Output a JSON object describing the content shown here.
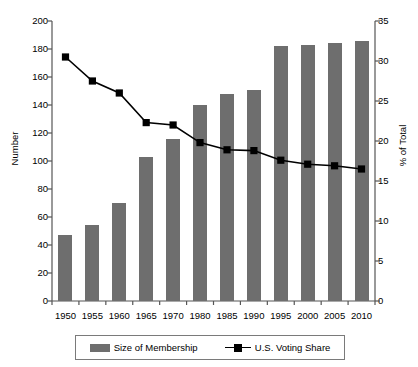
{
  "chart_data": {
    "type": "bar",
    "title": "",
    "subtitle": "",
    "categories": [
      "1950",
      "1955",
      "1960",
      "1965",
      "1970",
      "1980",
      "1985",
      "1990",
      "1995",
      "2000",
      "2005",
      "2010"
    ],
    "xlabel": "",
    "grid": false,
    "legend_position": "bottom",
    "series": [
      {
        "name": "Size of Membership",
        "type": "bar",
        "axis": "left",
        "color": "#6e6e6e",
        "values": [
          47,
          54,
          70,
          103,
          116,
          140,
          148,
          151,
          182,
          183,
          184,
          186
        ]
      },
      {
        "name": "U.S. Voting Share",
        "type": "line",
        "axis": "right",
        "color": "#000000",
        "marker": "square",
        "values": [
          30.5,
          27.5,
          26.0,
          22.3,
          22.0,
          19.8,
          18.9,
          18.8,
          17.6,
          17.1,
          16.9,
          16.5
        ]
      }
    ],
    "axes": {
      "left": {
        "label": "Number",
        "min": 0,
        "max": 200,
        "step": 20,
        "ticks": [
          "0",
          "20",
          "40",
          "60",
          "80",
          "100",
          "120",
          "140",
          "160",
          "180",
          "200"
        ]
      },
      "right": {
        "label": "% of Total",
        "min": 0,
        "max": 35,
        "step": 5,
        "ticks": [
          "0",
          "5",
          "10",
          "15",
          "20",
          "25",
          "30",
          "35"
        ]
      }
    }
  },
  "legend": {
    "items": [
      {
        "label": "Size of Membership",
        "marker": "bar-swatch"
      },
      {
        "label": "U.S. Voting Share",
        "marker": "line-square-marker"
      }
    ]
  }
}
